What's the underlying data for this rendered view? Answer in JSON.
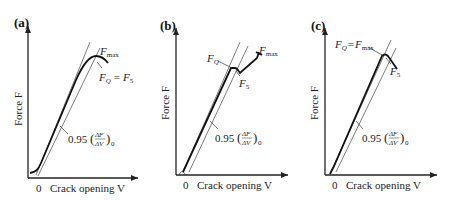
{
  "figure": {
    "panels": [
      {
        "id": "a",
        "label": "(a)",
        "xlabel": "Crack opening V",
        "ylabel": "Force F",
        "origin": "0",
        "slope_label": "0.95",
        "slope_frac_num": "ΔF",
        "slope_frac_den": "ΔV",
        "slope_sub": "0",
        "annotations": {
          "fmax": "F",
          "fmax_sub": "max",
          "fq": "F",
          "fq_sub": "Q",
          "eq": "=",
          "f5": "F",
          "f5_sub": "5"
        }
      },
      {
        "id": "b",
        "label": "(b)",
        "xlabel": "Crack opening V",
        "ylabel": "Force F",
        "origin": "0",
        "slope_label": "0.95",
        "slope_frac_num": "ΔF",
        "slope_frac_den": "ΔV",
        "slope_sub": "0",
        "annotations": {
          "fmax": "F",
          "fmax_sub": "max",
          "fq": "F",
          "fq_sub": "Q",
          "f5": "F",
          "f5_sub": "5"
        }
      },
      {
        "id": "c",
        "label": "(c)",
        "xlabel": "Crack opening V",
        "ylabel": "Force F",
        "origin": "0",
        "slope_label": "0.95",
        "slope_frac_num": "ΔF",
        "slope_frac_den": "ΔV",
        "slope_sub": "0",
        "annotations": {
          "fq": "F",
          "fq_sub": "Q",
          "eq": "=",
          "fmax": "F",
          "fmax_sub": "max",
          "f5": "F",
          "f5_sub": "5"
        }
      }
    ]
  }
}
